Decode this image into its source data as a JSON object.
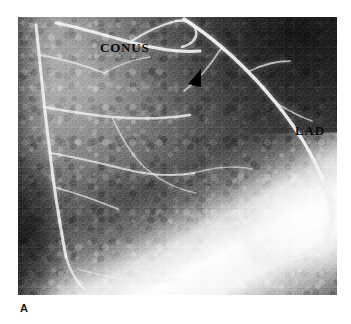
{
  "figure": {
    "panel_letter": "A",
    "modality": "coronary-angiogram",
    "background_color": "#ffffff"
  },
  "image": {
    "name": "coronary-angiogram-panel-a",
    "left": 18,
    "top": 17,
    "width": 319,
    "height": 278,
    "tone_description": "grainy grayscale radiographic angiogram, dark upper-right field, bright contrast-filled vessel network upper-left, broad lucent band across lower-right"
  },
  "annotations": {
    "conus": {
      "label": "CONUS",
      "icon": "text-label",
      "color": "#0b0b0b",
      "x": 82,
      "y": 24
    },
    "lad": {
      "label": "LAD",
      "icon": "text-label",
      "color": "#0b0b0b",
      "x": 277,
      "y": 107
    },
    "arrowhead": {
      "icon": "arrowhead-marker",
      "color": "#000000",
      "x": 169,
      "y": 51,
      "direction": "down-left"
    }
  },
  "vessels": {
    "accent_bright": "#f2f2f2",
    "accent_mid": "#d8d8d8",
    "paths": [
      {
        "name": "conus-branch",
        "d": "M 38 6 C 60 10, 86 18, 112 25 C 138 32, 160 36, 182 34",
        "width": 3.0,
        "opacity": 0.92
      },
      {
        "name": "conus-branch-upper",
        "d": "M 112 25 C 126 16, 142 8, 158 4",
        "width": 2.2,
        "opacity": 0.82
      },
      {
        "name": "conus-tip-loop",
        "d": "M 158 4 C 168 2, 176 6, 178 14 C 180 22, 172 28, 164 30",
        "width": 2.4,
        "opacity": 0.86
      },
      {
        "name": "lad-main",
        "d": "M 166 2 C 200 24, 232 54, 258 86 C 284 118, 302 150, 312 182",
        "width": 3.4,
        "opacity": 0.95
      },
      {
        "name": "lad-distal",
        "d": "M 312 182 C 316 200, 314 216, 304 228 C 294 240, 278 244, 262 240",
        "width": 2.8,
        "opacity": 0.82
      },
      {
        "name": "diagonal-branch-1",
        "d": "M 232 54 C 244 48, 258 44, 272 44",
        "width": 1.8,
        "opacity": 0.7
      },
      {
        "name": "diagonal-branch-2",
        "d": "M 258 86 C 268 92, 282 100, 294 104",
        "width": 1.6,
        "opacity": 0.62
      },
      {
        "name": "septal-branch-1",
        "d": "M 204 30 C 194 46, 182 62, 166 74",
        "width": 1.8,
        "opacity": 0.66
      },
      {
        "name": "left-vertical-trunk",
        "d": "M 18 8 C 22 44, 26 90, 32 136 C 36 172, 42 208, 48 240",
        "width": 3.0,
        "opacity": 0.88
      },
      {
        "name": "left-trunk-lower",
        "d": "M 48 240 C 52 254, 58 264, 66 272",
        "width": 2.4,
        "opacity": 0.78
      },
      {
        "name": "marginal-branch-1",
        "d": "M 26 90 C 48 94, 72 98, 94 100 C 118 102, 146 102, 172 98",
        "width": 2.4,
        "opacity": 0.8
      },
      {
        "name": "marginal-branch-2",
        "d": "M 32 136 C 56 140, 82 146, 106 152 C 130 158, 154 160, 176 156",
        "width": 2.0,
        "opacity": 0.72
      },
      {
        "name": "marginal-branch-3",
        "d": "M 36 170 C 58 176, 80 184, 100 192",
        "width": 1.8,
        "opacity": 0.66
      },
      {
        "name": "mid-web-1",
        "d": "M 94 100 C 102 118, 112 136, 126 150",
        "width": 1.6,
        "opacity": 0.6
      },
      {
        "name": "mid-web-2",
        "d": "M 126 150 C 140 162, 158 172, 178 176",
        "width": 1.6,
        "opacity": 0.58
      },
      {
        "name": "mid-web-3",
        "d": "M 176 156 C 196 150, 216 148, 234 152",
        "width": 1.5,
        "opacity": 0.55
      },
      {
        "name": "upper-left-web",
        "d": "M 22 38 C 44 42, 66 48, 86 56",
        "width": 1.8,
        "opacity": 0.64
      },
      {
        "name": "upper-left-web-2",
        "d": "M 86 56 C 100 48, 116 42, 132 40",
        "width": 1.5,
        "opacity": 0.56
      },
      {
        "name": "lower-arc",
        "d": "M 60 252 C 92 262, 126 266, 160 262",
        "width": 1.6,
        "opacity": 0.5
      }
    ]
  }
}
